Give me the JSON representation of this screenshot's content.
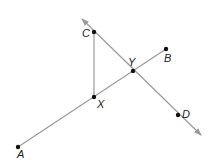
{
  "diagram": {
    "colors": {
      "line": "#9a9a9a",
      "point": "#111111",
      "label": "#222222",
      "background": "#ffffff"
    },
    "points": [
      {
        "id": "A",
        "label": "A",
        "x": 18,
        "y": 147,
        "lx": 17,
        "ly": 158
      },
      {
        "id": "B",
        "label": "B",
        "x": 166,
        "y": 49,
        "lx": 164,
        "ly": 62
      },
      {
        "id": "C",
        "label": "C",
        "x": 94,
        "y": 32,
        "lx": 82,
        "ly": 37
      },
      {
        "id": "D",
        "label": "D",
        "x": 178,
        "y": 115,
        "lx": 182,
        "ly": 118
      },
      {
        "id": "X",
        "label": "X",
        "x": 94,
        "y": 97,
        "lx": 97,
        "ly": 108
      },
      {
        "id": "Y",
        "label": "Y",
        "x": 133,
        "y": 71,
        "lx": 128,
        "ly": 66
      }
    ],
    "segments": [
      {
        "id": "AB",
        "from": "A",
        "to": "B"
      },
      {
        "id": "CX",
        "from": "C",
        "to": "X"
      }
    ],
    "lines": [
      {
        "id": "CD",
        "through": [
          "C",
          "Y",
          "D"
        ],
        "x1": 82,
        "y1": 19,
        "x2": 201,
        "y2": 135,
        "arrows": "both"
      }
    ]
  }
}
